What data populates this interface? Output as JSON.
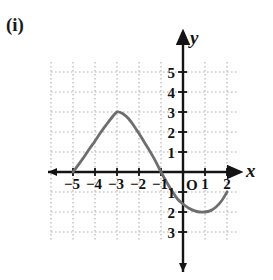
{
  "figure": {
    "part_label": "(i)",
    "axis_labels": {
      "x": "x",
      "y": "y"
    },
    "origin_label": "O"
  },
  "chart_data": {
    "type": "line",
    "title": "",
    "xlabel": "x",
    "ylabel": "y",
    "grid": true,
    "legend": "none",
    "xlim": [
      -6,
      2.5
    ],
    "ylim": [
      -3.5,
      5.5
    ],
    "xticks": [
      -5,
      -4,
      -3,
      -2,
      -1,
      1,
      2
    ],
    "xtick_labels": [
      "-5",
      "-4",
      "-3",
      "-2",
      "-1",
      "1",
      "2"
    ],
    "yticks": [
      5,
      4,
      3,
      2,
      1,
      -1,
      -2,
      -3
    ],
    "ytick_labels": [
      "5",
      "4",
      "3",
      "2",
      "1",
      "-1",
      "-2",
      "-3"
    ],
    "curve_color": "#6e6e6e",
    "axis_color": "#141414",
    "grid_color": "#b0b0b0",
    "annotations": {
      "x_intercepts": [
        -5,
        -1
      ],
      "maximum": {
        "x": -3,
        "y": 3
      },
      "minimum": {
        "x": 1,
        "y": -2
      },
      "curve_start": {
        "x": -5,
        "y": 0
      },
      "curve_end": {
        "x": 2,
        "y": -1
      }
    },
    "series": [
      {
        "name": "curve",
        "points": [
          [
            -5,
            0
          ],
          [
            -4.75,
            0.37
          ],
          [
            -4.5,
            0.75
          ],
          [
            -4.25,
            1.16
          ],
          [
            -4,
            1.55
          ],
          [
            -3.75,
            1.96
          ],
          [
            -3.5,
            2.34
          ],
          [
            -3.25,
            2.7
          ],
          [
            -3,
            3
          ],
          [
            -2.75,
            2.93
          ],
          [
            -2.5,
            2.7
          ],
          [
            -2.25,
            2.34
          ],
          [
            -2,
            1.92
          ],
          [
            -1.75,
            1.48
          ],
          [
            -1.5,
            1.03
          ],
          [
            -1.25,
            0.54
          ],
          [
            -1,
            0
          ],
          [
            -0.75,
            -0.5
          ],
          [
            -0.5,
            -0.95
          ],
          [
            -0.25,
            -1.35
          ],
          [
            0,
            -1.6
          ],
          [
            0.25,
            -1.8
          ],
          [
            0.5,
            -1.93
          ],
          [
            0.75,
            -2
          ],
          [
            1,
            -2
          ],
          [
            1.25,
            -1.93
          ],
          [
            1.5,
            -1.75
          ],
          [
            1.75,
            -1.45
          ],
          [
            2,
            -1
          ]
        ]
      }
    ]
  }
}
